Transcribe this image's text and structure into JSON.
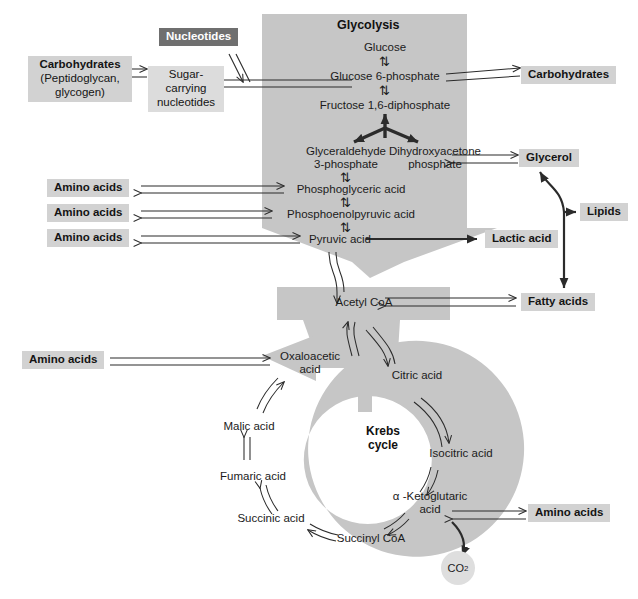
{
  "diagram": {
    "colors": {
      "ribbon": "#c6c6c6",
      "box_light": "#dcdcdc",
      "box_mid": "#d2d2d2",
      "box_dark": "#6f6f6f",
      "line": "#2b2b2b",
      "background": "#ffffff",
      "co2_circle": "#dedede"
    }
  },
  "glycolysis": {
    "heading": "Glycolysis",
    "intermediates": [
      {
        "id": "glucose",
        "label": "Glucose"
      },
      {
        "id": "g6p",
        "label": "Glucose 6-phosphate"
      },
      {
        "id": "f16dp",
        "label": "Fructose 1,6-diphosphate"
      },
      {
        "id": "g3p",
        "label": "Glyceraldehyde",
        "label2": "3-phosphate"
      },
      {
        "id": "dhap",
        "label": "Dihydroxyacetone",
        "label2": "phosphate"
      },
      {
        "id": "pga",
        "label": "Phosphoglyceric acid"
      },
      {
        "id": "pep",
        "label": "Phosphoenolpyruvic acid"
      },
      {
        "id": "pyruvate",
        "label": "Pyruvic acid"
      }
    ],
    "reversible_marker": "⇅"
  },
  "acetyl": {
    "label": "Acetyl CoA"
  },
  "krebs": {
    "title_line1": "Krebs",
    "title_line2": "cycle",
    "intermediates": [
      {
        "id": "oaa",
        "label": "Oxaloacetic",
        "label2": "acid"
      },
      {
        "id": "citrate",
        "label": "Citric acid"
      },
      {
        "id": "isocitrate",
        "label": "Isocitric acid"
      },
      {
        "id": "akg",
        "label": "α -Ketoglutaric",
        "label2": "acid"
      },
      {
        "id": "succoa",
        "label": "Succinyl CoA"
      },
      {
        "id": "succinate",
        "label": "Succinic acid"
      },
      {
        "id": "fumarate",
        "label": "Fumaric acid"
      },
      {
        "id": "malate",
        "label": "Malic acid"
      }
    ],
    "waste": {
      "id": "co2",
      "label": "CO",
      "subscript": "2"
    }
  },
  "side_boxes": [
    {
      "id": "nucleotides",
      "label": "Nucleotides",
      "style": "dark"
    },
    {
      "id": "carbohydrates-left",
      "label": "Carbohydrates",
      "sublabel": "(Peptidoglycan,",
      "sublabel2": "glycogen)",
      "style": "mid"
    },
    {
      "id": "sugar-nucleotides",
      "label": "Sugar-carrying",
      "sublabel": "nucleotides",
      "style": "light"
    },
    {
      "id": "carbohydrates-right",
      "label": "Carbohydrates",
      "style": "mid"
    },
    {
      "id": "glycerol",
      "label": "Glycerol",
      "style": "mid"
    },
    {
      "id": "lipids",
      "label": "Lipids",
      "style": "mid"
    },
    {
      "id": "lactic-acid",
      "label": "Lactic acid",
      "style": "mid"
    },
    {
      "id": "fatty-acids",
      "label": "Fatty acids",
      "style": "mid"
    },
    {
      "id": "amino-acids-1",
      "label": "Amino acids",
      "style": "mid"
    },
    {
      "id": "amino-acids-2",
      "label": "Amino acids",
      "style": "mid"
    },
    {
      "id": "amino-acids-3",
      "label": "Amino acids",
      "style": "mid"
    },
    {
      "id": "amino-acids-4",
      "label": "Amino acids",
      "style": "mid"
    },
    {
      "id": "amino-acids-5",
      "label": "Amino acids",
      "style": "mid"
    }
  ]
}
